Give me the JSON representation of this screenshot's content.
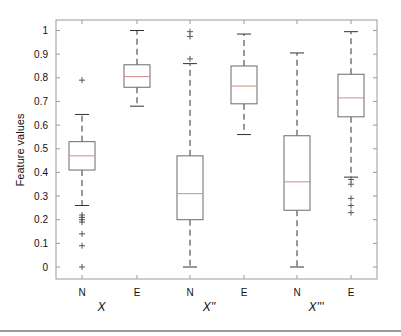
{
  "chart_data": {
    "type": "box",
    "title": "",
    "xlabel": "",
    "ylabel": "Feature values",
    "ylim": [
      -0.05,
      1.05
    ],
    "yticks": [
      0,
      0.1,
      0.2,
      0.3,
      0.4,
      0.5,
      0.6,
      0.7,
      0.8,
      0.9,
      1
    ],
    "ytick_labels": [
      "0",
      "0.1",
      "0.2",
      "0.3",
      "0.4",
      "0.5",
      "0.6",
      "0.7",
      "0.8",
      "0.9",
      "1"
    ],
    "grid": false,
    "legend": null,
    "categories": [
      "N",
      "E",
      "N",
      "E",
      "N",
      "E"
    ],
    "groups": [
      {
        "label": "X",
        "categories": [
          "N",
          "E"
        ]
      },
      {
        "label": "X''",
        "categories": [
          "N",
          "E"
        ]
      },
      {
        "label": "X'''",
        "categories": [
          "N",
          "E"
        ]
      }
    ],
    "boxes": [
      {
        "group": "X",
        "category": "N",
        "whisker_low": 0.26,
        "q1": 0.41,
        "median": 0.47,
        "q3": 0.53,
        "whisker_high": 0.645,
        "outliers": [
          0.79,
          0.22,
          0.21,
          0.2,
          0.19,
          0.14,
          0.09,
          0.0
        ]
      },
      {
        "group": "X",
        "category": "E",
        "whisker_low": 0.68,
        "q1": 0.76,
        "median": 0.805,
        "q3": 0.855,
        "whisker_high": 1.0,
        "outliers": []
      },
      {
        "group": "X''",
        "category": "N",
        "whisker_low": 0.0,
        "q1": 0.2,
        "median": 0.31,
        "q3": 0.47,
        "whisker_high": 0.86,
        "outliers": [
          0.88,
          0.975,
          0.995
        ]
      },
      {
        "group": "X''",
        "category": "E",
        "whisker_low": 0.56,
        "q1": 0.69,
        "median": 0.765,
        "q3": 0.85,
        "whisker_high": 0.985,
        "outliers": []
      },
      {
        "group": "X'''",
        "category": "N",
        "whisker_low": 0.0,
        "q1": 0.24,
        "median": 0.36,
        "q3": 0.555,
        "whisker_high": 0.905,
        "outliers": []
      },
      {
        "group": "X'''",
        "category": "E",
        "whisker_low": 0.38,
        "q1": 0.635,
        "median": 0.715,
        "q3": 0.815,
        "whisker_high": 0.995,
        "outliers": [
          0.37,
          0.35,
          0.29,
          0.26,
          0.23
        ]
      }
    ],
    "colors": {
      "box": "#6b6b6b",
      "median": "#d08a8a",
      "whisker": "#333333",
      "outlier": "#555555",
      "axis": "#9a9a9a"
    }
  }
}
